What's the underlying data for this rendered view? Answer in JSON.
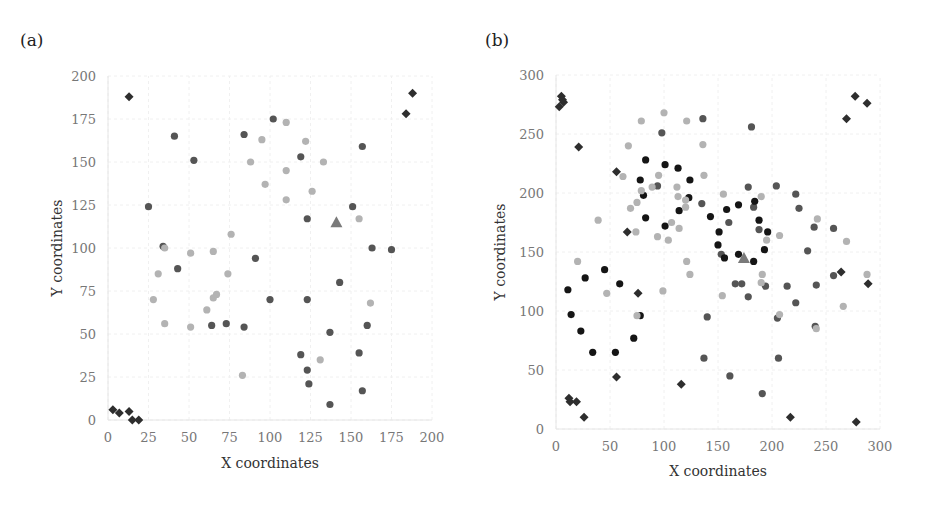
{
  "panels": [
    {
      "label": "(a)"
    },
    {
      "label": "(b)"
    }
  ],
  "colors": {
    "diamond": "#2e2e2e",
    "medium": "#555555",
    "light": "#b3b3b3",
    "dark": "#151515",
    "triangle": "#7a7a7a",
    "grid": "#f0f0f0",
    "tick": "#777777"
  },
  "chart_data": [
    {
      "type": "scatter",
      "title": "(a)",
      "xlabel": "X coordinates",
      "ylabel": "Y coordinates",
      "xlim": [
        0,
        200
      ],
      "ylim": [
        0,
        200
      ],
      "xticks": [
        0,
        25,
        50,
        75,
        100,
        125,
        150,
        175,
        200
      ],
      "yticks": [
        0,
        25,
        50,
        75,
        100,
        125,
        150,
        175,
        200
      ],
      "grid": true,
      "series": [
        {
          "name": "diamond",
          "marker": "diamond",
          "color": "#2e2e2e",
          "points": [
            [
              3,
              6
            ],
            [
              7,
              4
            ],
            [
              13,
              5
            ],
            [
              15,
              0
            ],
            [
              19,
              0
            ],
            [
              13,
              188
            ],
            [
              184,
              178
            ],
            [
              188,
              190
            ]
          ]
        },
        {
          "name": "medium",
          "marker": "circle",
          "color": "#555555",
          "points": [
            [
              25,
              124
            ],
            [
              34,
              101
            ],
            [
              41,
              165
            ],
            [
              43,
              88
            ],
            [
              53,
              151
            ],
            [
              64,
              55
            ],
            [
              73,
              56
            ],
            [
              84,
              54
            ],
            [
              84,
              166
            ],
            [
              91,
              94
            ],
            [
              100,
              70
            ],
            [
              102,
              175
            ],
            [
              119,
              153
            ],
            [
              123,
              117
            ],
            [
              123,
              70
            ],
            [
              119,
              38
            ],
            [
              123,
              29
            ],
            [
              124,
              21
            ],
            [
              137,
              51
            ],
            [
              137,
              9
            ],
            [
              143,
              80
            ],
            [
              151,
              124
            ],
            [
              155,
              39
            ],
            [
              157,
              17
            ],
            [
              157,
              159
            ],
            [
              160,
              55
            ],
            [
              163,
              100
            ],
            [
              175,
              99
            ]
          ]
        },
        {
          "name": "light",
          "marker": "circle",
          "color": "#b3b3b3",
          "points": [
            [
              28,
              70
            ],
            [
              31,
              85
            ],
            [
              35,
              56
            ],
            [
              35,
              100
            ],
            [
              51,
              97
            ],
            [
              51,
              54
            ],
            [
              61,
              64
            ],
            [
              65,
              71
            ],
            [
              65,
              98
            ],
            [
              67,
              73
            ],
            [
              74,
              85
            ],
            [
              76,
              108
            ],
            [
              83,
              26
            ],
            [
              88,
              150
            ],
            [
              95,
              163
            ],
            [
              97,
              137
            ],
            [
              110,
              145
            ],
            [
              110,
              173
            ],
            [
              110,
              128
            ],
            [
              122,
              162
            ],
            [
              126,
              133
            ],
            [
              131,
              35
            ],
            [
              133,
              150
            ],
            [
              155,
              117
            ],
            [
              162,
              68
            ]
          ]
        },
        {
          "name": "triangle",
          "marker": "triangle",
          "color": "#7a7a7a",
          "points": [
            [
              141,
              115
            ]
          ]
        }
      ]
    },
    {
      "type": "scatter",
      "title": "(b)",
      "xlabel": "X coordinates",
      "ylabel": "Y coordinates",
      "xlim": [
        0,
        300
      ],
      "ylim": [
        0,
        300
      ],
      "xticks": [
        0,
        50,
        100,
        150,
        200,
        250,
        300
      ],
      "yticks": [
        0,
        50,
        100,
        150,
        200,
        250,
        300
      ],
      "grid": true,
      "series": [
        {
          "name": "diamond",
          "marker": "diamond",
          "color": "#2e2e2e",
          "points": [
            [
              5,
              282
            ],
            [
              7,
              277
            ],
            [
              3,
              273
            ],
            [
              6,
              279
            ],
            [
              12,
              26
            ],
            [
              13,
              23
            ],
            [
              19,
              23
            ],
            [
              26,
              10
            ],
            [
              21,
              239
            ],
            [
              56,
              218
            ],
            [
              66,
              167
            ],
            [
              76,
              115
            ],
            [
              56,
              44
            ],
            [
              116,
              38
            ],
            [
              217,
              10
            ],
            [
              278,
              6
            ],
            [
              269,
              263
            ],
            [
              277,
              282
            ],
            [
              288,
              276
            ],
            [
              264,
              133
            ],
            [
              289,
              123
            ]
          ]
        },
        {
          "name": "medium",
          "marker": "circle",
          "color": "#555555",
          "points": [
            [
              98,
              251
            ],
            [
              136,
              263
            ],
            [
              181,
              256
            ],
            [
              94,
              206
            ],
            [
              135,
              191
            ],
            [
              160,
              175
            ],
            [
              178,
              205
            ],
            [
              183,
              188
            ],
            [
              188,
              169
            ],
            [
              204,
              206
            ],
            [
              222,
              199
            ],
            [
              225,
              187
            ],
            [
              172,
              123
            ],
            [
              166,
              123
            ],
            [
              178,
              112
            ],
            [
              194,
              121
            ],
            [
              214,
              121
            ],
            [
              222,
              107
            ],
            [
              233,
              151
            ],
            [
              239,
              171
            ],
            [
              241,
              122
            ],
            [
              257,
              130
            ],
            [
              257,
              170
            ],
            [
              240,
              87
            ],
            [
              205,
              94
            ],
            [
              140,
              95
            ],
            [
              137,
              60
            ],
            [
              161,
              45
            ],
            [
              191,
              30
            ],
            [
              206,
              60
            ],
            [
              153,
              148
            ]
          ]
        },
        {
          "name": "dark",
          "marker": "circle",
          "color": "#151515",
          "points": [
            [
              11,
              118
            ],
            [
              14,
              97
            ],
            [
              23,
              83
            ],
            [
              34,
              65
            ],
            [
              45,
              135
            ],
            [
              27,
              128
            ],
            [
              55,
              65
            ],
            [
              59,
              123
            ],
            [
              72,
              77
            ],
            [
              78,
              96
            ],
            [
              78,
              211
            ],
            [
              83,
              179
            ],
            [
              81,
              198
            ],
            [
              83,
              228
            ],
            [
              101,
              224
            ],
            [
              101,
              172
            ],
            [
              113,
              221
            ],
            [
              114,
              185
            ],
            [
              123,
              196
            ],
            [
              124,
              211
            ],
            [
              143,
              180
            ],
            [
              151,
              167
            ],
            [
              150,
              156
            ],
            [
              156,
              145
            ],
            [
              158,
              186
            ],
            [
              169,
              190
            ],
            [
              169,
              148
            ],
            [
              184,
              193
            ],
            [
              183,
              142
            ],
            [
              188,
              177
            ],
            [
              193,
              152
            ],
            [
              196,
              167
            ]
          ]
        },
        {
          "name": "light",
          "marker": "circle",
          "color": "#b3b3b3",
          "points": [
            [
              20,
              142
            ],
            [
              39,
              177
            ],
            [
              47,
              115
            ],
            [
              67,
              240
            ],
            [
              69,
              187
            ],
            [
              62,
              214
            ],
            [
              75,
              192
            ],
            [
              74,
              167
            ],
            [
              79,
              202
            ],
            [
              89,
              205
            ],
            [
              94,
              163
            ],
            [
              95,
              215
            ],
            [
              99,
              117
            ],
            [
              100,
              268
            ],
            [
              104,
              160
            ],
            [
              107,
              175
            ],
            [
              112,
              205
            ],
            [
              113,
              197
            ],
            [
              114,
              170
            ],
            [
              120,
              188
            ],
            [
              120,
              194
            ],
            [
              121,
              142
            ],
            [
              121,
              261
            ],
            [
              124,
              131
            ],
            [
              136,
              241
            ],
            [
              137,
              215
            ],
            [
              154,
              113
            ],
            [
              155,
              199
            ],
            [
              190,
              197
            ],
            [
              190,
              124
            ],
            [
              191,
              131
            ],
            [
              195,
              160
            ],
            [
              207,
              97
            ],
            [
              207,
              164
            ],
            [
              241,
              85
            ],
            [
              242,
              178
            ],
            [
              269,
              159
            ],
            [
              266,
              104
            ],
            [
              288,
              131
            ],
            [
              75,
              96
            ],
            [
              79,
              261
            ]
          ]
        },
        {
          "name": "triangle",
          "marker": "triangle",
          "color": "#7a7a7a",
          "points": [
            [
              174,
              145
            ]
          ]
        }
      ]
    }
  ]
}
